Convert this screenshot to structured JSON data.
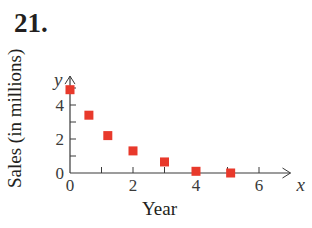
{
  "problem_number": "21.",
  "chart_data": {
    "type": "scatter",
    "title": "",
    "xlabel": "Year",
    "ylabel": "Sales (in millions)",
    "x_axis_symbol": "x",
    "y_axis_symbol": "y",
    "xlim": [
      0,
      7
    ],
    "ylim": [
      0,
      5.5
    ],
    "x_ticks": [
      0,
      2,
      4,
      6
    ],
    "y_ticks": [
      0,
      2,
      4
    ],
    "x_tick_labels": [
      "0",
      "2",
      "4",
      "6"
    ],
    "y_tick_labels": [
      "0",
      "2",
      "4"
    ],
    "grid": false,
    "legend": null,
    "marker": "square",
    "marker_color": "#e8392b",
    "series": [
      {
        "name": "Sales",
        "x": [
          0,
          0.6,
          1.2,
          2.0,
          3.0,
          4.0,
          5.1
        ],
        "y": [
          4.9,
          3.4,
          2.2,
          1.3,
          0.65,
          0.1,
          0.0
        ]
      }
    ]
  }
}
